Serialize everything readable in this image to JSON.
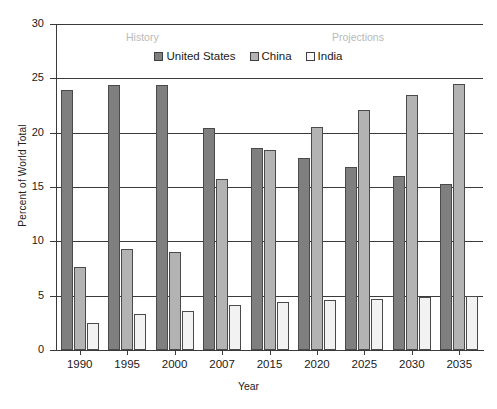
{
  "chart_data": {
    "type": "bar",
    "title": "",
    "xlabel": "Year",
    "ylabel": "Percent of World Total",
    "ylim": [
      0,
      30
    ],
    "yticks": [
      0,
      5,
      10,
      15,
      20,
      25,
      30
    ],
    "grid": true,
    "legend_position": "top-center",
    "categories": [
      "1990",
      "1995",
      "2000",
      "2007",
      "2015",
      "2020",
      "2025",
      "2030",
      "2035"
    ],
    "series": [
      {
        "name": "United States",
        "color": "#7f7f7f",
        "values": [
          23.9,
          24.4,
          24.4,
          20.4,
          18.6,
          17.7,
          16.8,
          16.0,
          15.3
        ]
      },
      {
        "name": "China",
        "color": "#b3b3b3",
        "values": [
          7.6,
          9.3,
          9.0,
          15.7,
          18.4,
          20.5,
          22.1,
          23.5,
          24.5
        ]
      },
      {
        "name": "India",
        "color": "#f2f2f2",
        "values": [
          2.5,
          3.3,
          3.6,
          4.1,
          4.4,
          4.6,
          4.7,
          4.9,
          5.0
        ]
      }
    ],
    "annotations": [
      {
        "text": "History",
        "color": "#b9b9b9"
      },
      {
        "text": "Projections",
        "color": "#b9b9b9"
      }
    ]
  },
  "axes": {
    "y_title": "Percent of World Total",
    "x_title": "Year",
    "y_labels": [
      "30",
      "25",
      "20",
      "15",
      "10",
      "5",
      "0"
    ],
    "x_labels": [
      "1990",
      "1995",
      "2000",
      "2007",
      "2015",
      "2020",
      "2025",
      "2030",
      "2035"
    ]
  },
  "legend": {
    "items": [
      {
        "label": "United States"
      },
      {
        "label": "China"
      },
      {
        "label": "India"
      }
    ]
  },
  "annotations": {
    "history": "History",
    "projections": "Projections"
  }
}
